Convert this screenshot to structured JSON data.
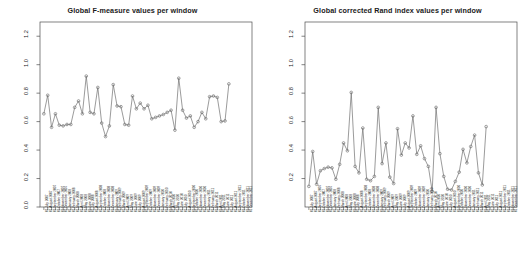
{
  "figure": {
    "background": "#ffffff",
    "panel_count": 2,
    "line_color": "#707070",
    "point_color": "#707070",
    "axis_color": "#4d4d4d"
  },
  "chart_data": [
    {
      "type": "line",
      "title": "Global F-measure values per window",
      "xlabel": "",
      "ylabel": "",
      "ylim": [
        0.0,
        1.3
      ],
      "yticks": [
        "0.0",
        "0.2",
        "0.4",
        "0.6",
        "0.8",
        "1.0",
        "1.2"
      ],
      "ytickvals": [
        0.0,
        0.2,
        0.4,
        0.6,
        0.8,
        1.0,
        1.2
      ],
      "grid": false,
      "legend": "none",
      "marker": "open-circle",
      "categories": [
        "01 July 2007",
        "01 August 2007",
        "01 September 2007",
        "01 October 2007",
        "01 November 2007",
        "01 December 2007",
        "01 January 2008",
        "01 February 2008",
        "01 March 2008",
        "01 April 2008",
        "01 May 2008",
        "01 June 2008",
        "01 July 2008",
        "01 August 2008",
        "01 September 2008",
        "01 October 2008",
        "01 November 2008",
        "01 December 2008",
        "01 January 2009",
        "01 February 2009",
        "01 March 2009",
        "01 April 2009",
        "01 May 2009",
        "01 June 2009",
        "01 July 2009",
        "01 August 2009",
        "01 September 2009",
        "01 October 2009",
        "01 November 2009",
        "01 December 2009",
        "01 January 2010",
        "01 February 2010",
        "01 March 2010",
        "01 April 2010",
        "01 May 2010",
        "01 June 2010",
        "01 July 2010",
        "01 August 2010",
        "01 September 2010",
        "01 October 2010",
        "01 November 2010",
        "01 December 2010",
        "01 January 2011",
        "01 February 2011",
        "01 March 2011",
        "01 April 2011",
        "01 May 2011",
        "01 June 2011",
        "01 July 2011",
        "01 August 2011",
        "01 September 2011",
        "01 October 2011",
        "01 November 2011",
        "01 December 2011"
      ],
      "values": [
        0.655,
        0.785,
        0.56,
        0.655,
        0.575,
        0.57,
        0.58,
        0.58,
        0.7,
        0.745,
        0.655,
        0.92,
        0.665,
        0.655,
        0.84,
        0.59,
        0.495,
        0.57,
        0.86,
        0.71,
        0.705,
        0.58,
        0.575,
        0.78,
        0.69,
        0.73,
        0.69,
        0.715,
        0.62,
        0.63,
        0.64,
        0.65,
        0.665,
        0.68,
        0.54,
        0.905,
        0.68,
        0.625,
        0.64,
        0.56,
        0.6,
        0.665,
        0.62,
        0.775,
        0.78,
        0.77,
        0.6,
        0.605,
        0.865
      ]
    },
    {
      "type": "line",
      "title": "Global corrected Rand index values per window",
      "xlabel": "",
      "ylabel": "",
      "ylim": [
        0.0,
        1.3
      ],
      "yticks": [
        "0.2",
        "0.4",
        "0.6",
        "0.8",
        "1.0",
        "1.2"
      ],
      "ytickvals": [
        0.2,
        0.4,
        0.6,
        0.8,
        1.0,
        1.2
      ],
      "grid": false,
      "legend": "none",
      "marker": "open-circle",
      "categories": [
        "01 July 2007",
        "01 August 2007",
        "01 September 2007",
        "01 October 2007",
        "01 November 2007",
        "01 December 2007",
        "01 January 2008",
        "01 February 2008",
        "01 March 2008",
        "01 April 2008",
        "01 May 2008",
        "01 June 2008",
        "01 July 2008",
        "01 August 2008",
        "01 September 2008",
        "01 October 2008",
        "01 November 2008",
        "01 December 2008",
        "01 January 2009",
        "01 February 2009",
        "01 March 2009",
        "01 April 2009",
        "01 May 2009",
        "01 June 2009",
        "01 July 2009",
        "01 August 2009",
        "01 September 2009",
        "01 October 2009",
        "01 November 2009",
        "01 December 2009",
        "01 January 2010",
        "01 February 2010",
        "01 March 2010",
        "01 April 2010",
        "01 May 2010",
        "01 June 2010",
        "01 July 2010",
        "01 August 2010",
        "01 September 2010",
        "01 October 2010",
        "01 November 2010",
        "01 December 2010",
        "01 January 2011",
        "01 February 2011",
        "01 March 2011",
        "01 April 2011",
        "01 May 2011",
        "01 June 2011",
        "01 July 2011",
        "01 August 2011",
        "01 September 2011",
        "01 October 2011",
        "01 November 2011",
        "01 December 2011"
      ],
      "values": [
        0.145,
        0.39,
        0.16,
        0.255,
        0.27,
        0.28,
        0.275,
        0.195,
        0.3,
        0.45,
        0.395,
        0.805,
        0.285,
        0.24,
        0.555,
        0.195,
        0.185,
        0.215,
        0.7,
        0.305,
        0.45,
        0.21,
        0.165,
        0.55,
        0.365,
        0.45,
        0.415,
        0.64,
        0.37,
        0.43,
        0.34,
        0.285,
        0.11,
        0.7,
        0.375,
        0.215,
        0.125,
        0.12,
        0.18,
        0.245,
        0.405,
        0.31,
        0.425,
        0.505,
        0.24,
        0.155,
        0.565
      ]
    }
  ]
}
